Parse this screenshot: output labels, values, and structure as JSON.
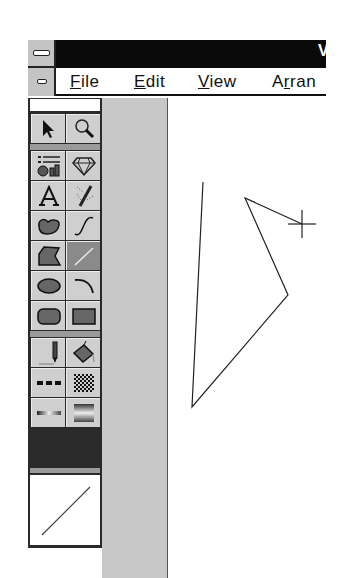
{
  "window": {
    "title_partial": "V",
    "system_menu_icon": "minus-bar-icon"
  },
  "menubar": {
    "system_icon": "minus-bar-icon",
    "items": [
      {
        "label": "File",
        "mnemonic": "F"
      },
      {
        "label": "Edit",
        "mnemonic": "E"
      },
      {
        "label": "View",
        "mnemonic": "V"
      },
      {
        "label": "Arran",
        "mnemonic": "r"
      }
    ]
  },
  "toolbox": {
    "tools": [
      {
        "name": "pointer",
        "icon": "arrow-pointer-icon"
      },
      {
        "name": "zoom",
        "icon": "magnifier-icon"
      },
      {
        "name": "chart",
        "icon": "chart-icon"
      },
      {
        "name": "symbol",
        "icon": "diamond-icon"
      },
      {
        "name": "text",
        "icon": "letter-a-icon"
      },
      {
        "name": "pencil-freehand",
        "icon": "pencil-dotted-icon"
      },
      {
        "name": "freeform",
        "icon": "blob-icon"
      },
      {
        "name": "bezier",
        "icon": "s-curve-icon"
      },
      {
        "name": "polygon",
        "icon": "polygon-icon"
      },
      {
        "name": "line",
        "icon": "line-icon",
        "active": true
      },
      {
        "name": "ellipse",
        "icon": "ellipse-icon"
      },
      {
        "name": "arc",
        "icon": "arc-icon"
      },
      {
        "name": "rounded-rect",
        "icon": "rounded-rect-icon"
      },
      {
        "name": "rectangle",
        "icon": "rectangle-icon"
      },
      {
        "name": "outline-pen",
        "icon": "pen-icon"
      },
      {
        "name": "fill",
        "icon": "paint-bucket-icon"
      },
      {
        "name": "line-style",
        "icon": "dashes-icon"
      },
      {
        "name": "fill-pattern",
        "icon": "checker-pattern-icon"
      },
      {
        "name": "line-gradient",
        "icon": "gradient-line-icon"
      },
      {
        "name": "gradient-fill",
        "icon": "gradient-fill-icon"
      }
    ],
    "preview": "diagonal-line-preview"
  },
  "canvas": {
    "polyline": [
      [
        203,
        182
      ],
      [
        192,
        407
      ],
      [
        288,
        295
      ],
      [
        245,
        198
      ],
      [
        302,
        224
      ]
    ],
    "cursor": {
      "x": 302,
      "y": 224,
      "icon": "crosshair-icon"
    }
  },
  "colors": {
    "titlebar": "#0a0a0a",
    "toolbox_bg": "#2a2a2a",
    "tool_cell": "#cfcfcf",
    "tool_active": "#8a8a8a",
    "strip": "#c8c8c8"
  }
}
